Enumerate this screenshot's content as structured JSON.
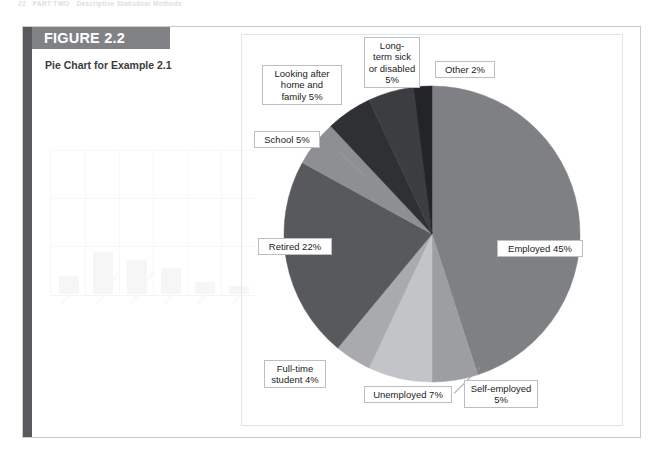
{
  "page": {
    "running_head_number": "22",
    "running_head_part": "PART TWO",
    "running_head_title": "Descriptive Statistical Methods"
  },
  "figure": {
    "banner_label": "FIGURE 2.2",
    "subtitle": "Pie Chart for Example 2.1",
    "frame_color": "#c9cacc",
    "spine_color": "#595a5e",
    "banner_color": "#818286"
  },
  "chart_data": {
    "type": "pie",
    "title": "Pie Chart for Example 2.1",
    "subtitle": "",
    "xlabel": "",
    "ylabel": "",
    "legend_position": "none",
    "grid": false,
    "units": "percent",
    "total": 100,
    "start_angle_deg": -90,
    "direction": "clockwise",
    "categories": [
      "Employed",
      "Self-employed",
      "Unemployed",
      "Full-time student",
      "Retired",
      "School",
      "Looking after home and family",
      "Long-term sick or disabled",
      "Other"
    ],
    "values": [
      45,
      5,
      7,
      4,
      22,
      5,
      5,
      5,
      2
    ],
    "labels": [
      "Employed 45%",
      "Self-employed\n5%",
      "Unemployed 7%",
      "Full-time\nstudent 4%",
      "Retired 22%",
      "School 5%",
      "Looking after\nhome and\nfamily 5%",
      "Long-\nterm sick\nor disabled\n5%",
      "Other 2%"
    ],
    "colors": [
      "#7f8083",
      "#9d9ea1",
      "#c3c4c7",
      "#a9aaad",
      "#58595c",
      "#8e8f92",
      "#2f3033",
      "#3c3d40",
      "#232427"
    ]
  },
  "showthrough": {
    "tick_labels": [
      "Frozen",
      "Fresh and chilled",
      "Ambient and other",
      "Beverages",
      "Bakery",
      "Dairy"
    ]
  }
}
